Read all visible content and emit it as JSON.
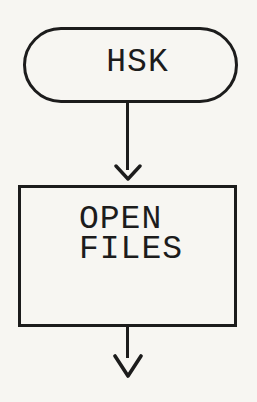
{
  "page": {
    "background_color": "#f7f6f2",
    "ink_color": "#1c1c1c"
  },
  "flowchart": {
    "start_node": {
      "shape": "terminator",
      "label": "HSK"
    },
    "process_node": {
      "shape": "process",
      "label_line1": "OPEN",
      "label_line2": "FILES"
    },
    "connectors": [
      {
        "from": "start-node",
        "to": "process-node",
        "style": "arrow-down"
      },
      {
        "from": "process-node",
        "to": "offpage-next-step",
        "style": "arrow-down"
      }
    ]
  }
}
